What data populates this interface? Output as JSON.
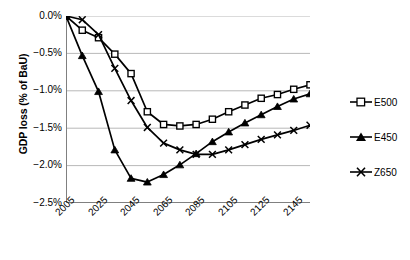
{
  "chart_data": {
    "type": "line",
    "title": "",
    "xlabel": "",
    "ylabel": "GDP loss (% of BaU)",
    "xlim": [
      2005,
      2155
    ],
    "ylim": [
      -2.5,
      0.0
    ],
    "y_tick_labels": [
      "0.0%",
      "-0.5%",
      "-1.0%",
      "-1.5%",
      "-2.0%",
      "-2.5%"
    ],
    "y_tick_values": [
      0.0,
      -0.5,
      -1.0,
      -1.5,
      -2.0,
      -2.5
    ],
    "x_tick_labels": [
      "2005",
      "2025",
      "2045",
      "2065",
      "2085",
      "2105",
      "2125",
      "2145"
    ],
    "x_tick_values": [
      2005,
      2025,
      2045,
      2065,
      2085,
      2105,
      2125,
      2145
    ],
    "x_minor_step": 10,
    "grid": "horizontal",
    "legend_position": "right",
    "x": [
      2005,
      2015,
      2025,
      2035,
      2045,
      2055,
      2065,
      2075,
      2085,
      2095,
      2105,
      2115,
      2125,
      2135,
      2145,
      2155
    ],
    "series": [
      {
        "name": "E500",
        "marker": "open-square",
        "color": "#000000",
        "values": [
          0.0,
          -0.19,
          -0.29,
          -0.51,
          -0.77,
          -1.28,
          -1.45,
          -1.47,
          -1.45,
          -1.38,
          -1.28,
          -1.19,
          -1.1,
          -1.05,
          -0.98,
          -0.92
        ]
      },
      {
        "name": "E450",
        "marker": "filled-triangle",
        "color": "#000000",
        "values": [
          0.0,
          -0.53,
          -1.01,
          -1.79,
          -2.17,
          -2.22,
          -2.12,
          -1.99,
          -1.84,
          -1.68,
          -1.55,
          -1.43,
          -1.32,
          -1.21,
          -1.11,
          -1.04
        ]
      },
      {
        "name": "Z650",
        "marker": "cross-x",
        "color": "#000000",
        "values": [
          0.0,
          -0.05,
          -0.25,
          -0.7,
          -1.13,
          -1.49,
          -1.7,
          -1.79,
          -1.85,
          -1.85,
          -1.79,
          -1.72,
          -1.65,
          -1.59,
          -1.53,
          -1.46
        ]
      }
    ]
  },
  "legend": {
    "items": [
      {
        "label": "E500",
        "marker": "open-square"
      },
      {
        "label": "E450",
        "marker": "filled-triangle"
      },
      {
        "label": "Z650",
        "marker": "cross-x"
      }
    ]
  },
  "axis": {
    "y_title": "GDP loss (% of BaU)"
  },
  "colors": {
    "line": "#000000",
    "grid": "#b0b0b0",
    "axis": "#808080",
    "background": "#ffffff"
  }
}
